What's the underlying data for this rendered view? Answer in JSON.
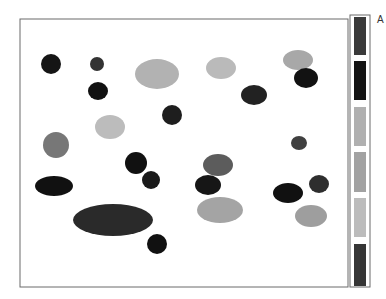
{
  "figure": {
    "corner_label": "A",
    "palette": {
      "black": "#141414",
      "dark": "#2e2e2e",
      "mid_dark": "#555555",
      "mid": "#7a7a7a",
      "light": "#a8a8a8",
      "lighter": "#bdbdbd"
    },
    "legend_swatches": [
      "dark",
      "black",
      "light",
      "mid_light",
      "lighter",
      "dark"
    ],
    "legend_colors": [
      "#3a3a3a",
      "#141414",
      "#b0b0b0",
      "#a2a2a2",
      "#bcbcbc",
      "#363636"
    ],
    "blob_count": 24
  }
}
